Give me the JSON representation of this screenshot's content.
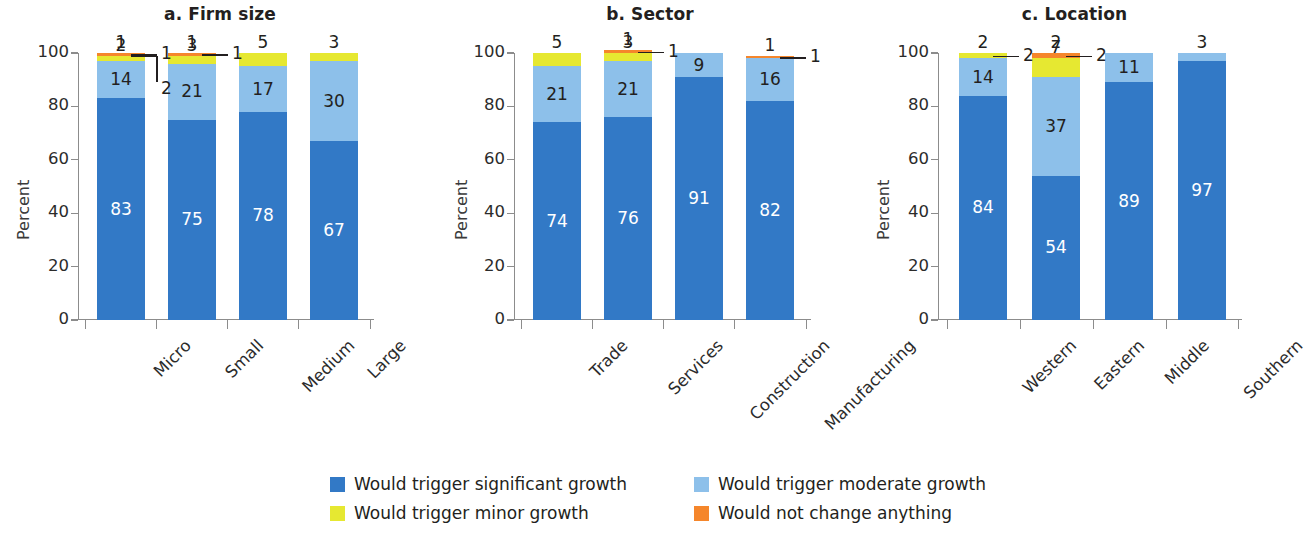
{
  "chart_data": {
    "type": "bar",
    "subtype": "stacked-bar-100-percent",
    "title": "",
    "ylabel": "Percent",
    "ylim": [
      0,
      100
    ],
    "yticks": [
      0,
      20,
      40,
      60,
      80,
      100
    ],
    "grid": false,
    "legend_position": "bottom",
    "colors": {
      "significant": "#3279c6",
      "moderate": "#8dc0ea",
      "minor": "#e6e831",
      "no_change": "#f5862b"
    },
    "series": [
      {
        "name": "Would trigger significant growth",
        "key": "significant"
      },
      {
        "name": "Would trigger moderate growth",
        "key": "moderate"
      },
      {
        "name": "Would trigger minor growth",
        "key": "minor"
      },
      {
        "name": "Would not change anything",
        "key": "no_change"
      }
    ],
    "panels": [
      {
        "id": "a",
        "title": "a. Firm size",
        "xlabel": "",
        "categories": [
          "Micro",
          "Small",
          "Medium",
          "Large"
        ],
        "values": {
          "significant": [
            83,
            75,
            78,
            67
          ],
          "moderate": [
            14,
            21,
            17,
            30
          ],
          "minor": [
            2,
            3,
            5,
            3
          ],
          "no_change": [
            1,
            1,
            0,
            0
          ]
        },
        "labels": {
          "significant": [
            "83",
            "75",
            "78",
            "67"
          ],
          "moderate": [
            "14",
            "21",
            "17",
            "30"
          ],
          "minor": [
            "2",
            "3",
            "5",
            "3"
          ],
          "no_change": [
            "1",
            "1",
            "",
            ""
          ]
        }
      },
      {
        "id": "b",
        "title": "b. Sector",
        "xlabel": "",
        "categories": [
          "Trade",
          "Services",
          "Construction",
          "Manufacturing"
        ],
        "values": {
          "significant": [
            74,
            76,
            91,
            82
          ],
          "moderate": [
            21,
            21,
            9,
            16
          ],
          "minor": [
            5,
            3,
            0,
            0
          ],
          "no_change": [
            0,
            1,
            0,
            1
          ]
        },
        "labels": {
          "significant": [
            "74",
            "76",
            "91",
            "82"
          ],
          "moderate": [
            "21",
            "21",
            "9",
            "16"
          ],
          "minor": [
            "5",
            "3",
            "",
            ""
          ],
          "no_change": [
            "",
            "1",
            "",
            "1"
          ]
        }
      },
      {
        "id": "c",
        "title": "c. Location",
        "xlabel": "",
        "categories": [
          "Western",
          "Eastern",
          "Middle",
          "Southern"
        ],
        "values": {
          "significant": [
            84,
            54,
            89,
            97
          ],
          "moderate": [
            14,
            37,
            11,
            3
          ],
          "minor": [
            2,
            7,
            0,
            0
          ],
          "no_change": [
            0,
            2,
            0,
            0
          ]
        },
        "labels": {
          "significant": [
            "84",
            "54",
            "89",
            "97"
          ],
          "moderate": [
            "14",
            "37",
            "11",
            "3"
          ],
          "minor": [
            "2",
            "7",
            "",
            ""
          ],
          "no_change": [
            "",
            "2",
            "",
            ""
          ]
        }
      }
    ],
    "callouts": [
      {
        "panel": "a",
        "bar": 0,
        "text": "1",
        "series": "no_change"
      },
      {
        "panel": "a",
        "bar": 0,
        "text": "2",
        "series": "minor"
      },
      {
        "panel": "a",
        "bar": 1,
        "text": "1",
        "series": "no_change"
      },
      {
        "panel": "b",
        "bar": 1,
        "text": "1",
        "series": "no_change"
      },
      {
        "panel": "b",
        "bar": 3,
        "text": "1",
        "series": "no_change"
      },
      {
        "panel": "c",
        "bar": 0,
        "text": "2",
        "series": "minor"
      },
      {
        "panel": "c",
        "bar": 1,
        "text": "2",
        "series": "no_change"
      }
    ]
  },
  "legend": {
    "items": [
      {
        "label": "Would trigger significant growth",
        "color": "#3279c6"
      },
      {
        "label": "Would trigger moderate growth",
        "color": "#8dc0ea"
      },
      {
        "label": "Would trigger minor growth",
        "color": "#e6e831"
      },
      {
        "label": "Would not change anything",
        "color": "#f5862b"
      }
    ]
  }
}
